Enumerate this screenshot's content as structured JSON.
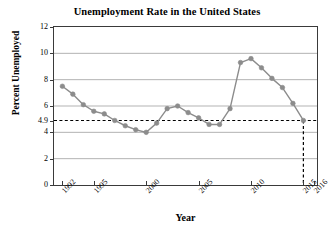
{
  "chart_data": {
    "type": "line",
    "title": "Unemployment Rate in the United States",
    "xlabel": "Year",
    "ylabel": "Percent Unemployed",
    "xlim": [
      1991.2,
      2016.3
    ],
    "ylim": [
      0,
      12
    ],
    "grid": true,
    "legend": null,
    "series_color": "#8c8c8c",
    "marker": "circle",
    "x": [
      1992,
      1993,
      1994,
      1995,
      1996,
      1997,
      1998,
      1999,
      2000,
      2001,
      2002,
      2003,
      2004,
      2005,
      2006,
      2007,
      2008,
      2009,
      2010,
      2011,
      2012,
      2013,
      2014,
      2015
    ],
    "values": [
      7.5,
      6.9,
      6.1,
      5.6,
      5.4,
      4.9,
      4.5,
      4.2,
      4.0,
      4.7,
      5.8,
      6.0,
      5.5,
      5.1,
      4.6,
      4.6,
      5.8,
      9.3,
      9.6,
      8.9,
      8.1,
      7.4,
      6.2,
      4.9
    ],
    "xticks": [
      1992,
      1995,
      2000,
      2005,
      2010,
      2015,
      2016
    ],
    "xtick_labels": [
      "1992",
      "1995",
      "2000",
      "2005",
      "2010",
      "2015",
      "2016"
    ],
    "yticks": [
      0,
      2,
      4,
      4.9,
      6,
      8,
      10,
      12
    ],
    "ytick_labels": [
      "0",
      "2",
      "4",
      "4.9",
      "6",
      "8",
      "10",
      "12"
    ],
    "gridline_values": [
      2,
      4,
      6,
      8,
      10
    ],
    "annotations": [
      {
        "name": "reference-line-horizontal",
        "type": "hline",
        "value": 4.9,
        "style": "dashed",
        "color": "#000000"
      },
      {
        "name": "reference-line-vertical",
        "type": "vline",
        "value": 2015,
        "style": "dashed",
        "color": "#000000",
        "from": 0,
        "to": 4.9
      }
    ]
  }
}
